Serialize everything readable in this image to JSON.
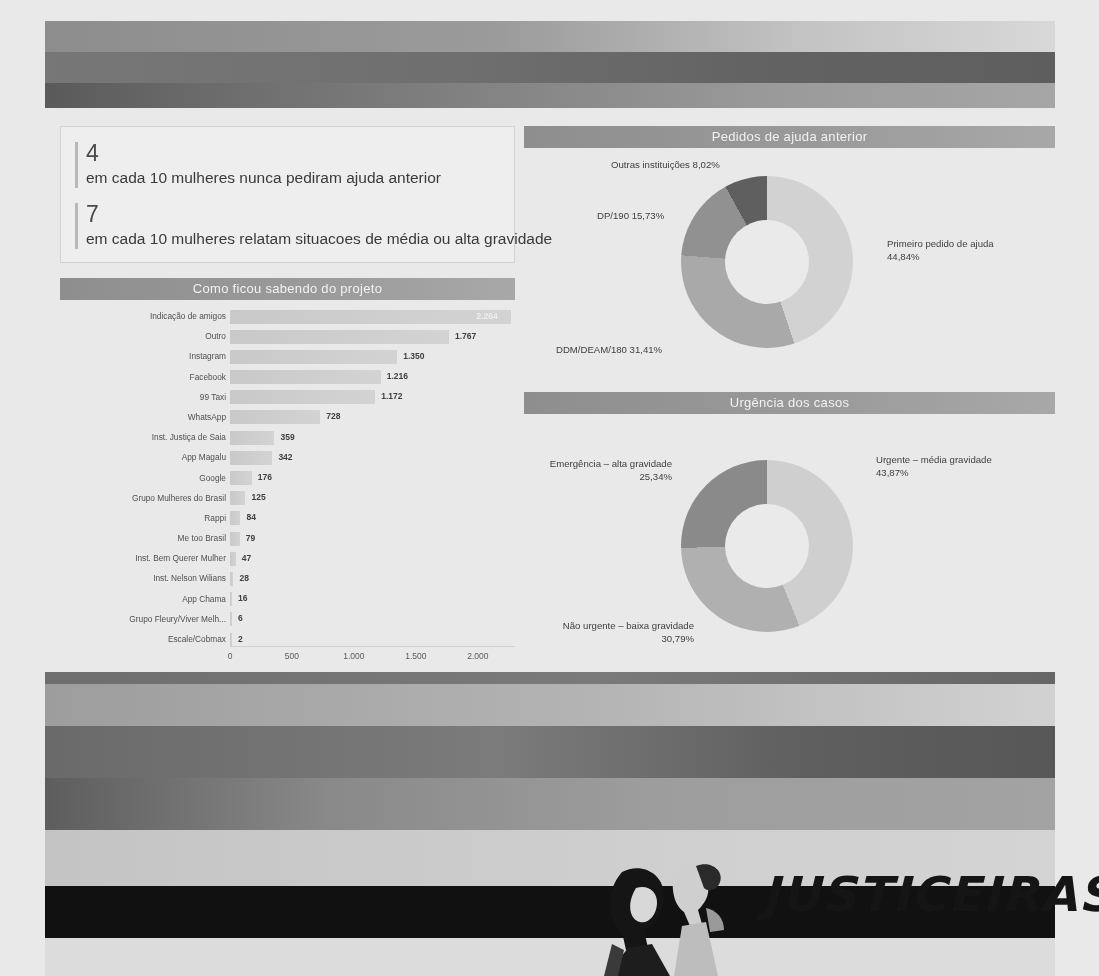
{
  "header": {
    "banner_name": "gradient-header-banner"
  },
  "kpis": [
    {
      "number": "4",
      "text": "em cada 10 mulheres nunca pediram ajuda anterior"
    },
    {
      "number": "7",
      "text": "em cada 10 mulheres relatam situacoes de média ou alta gravidade"
    }
  ],
  "chart_data": [
    {
      "type": "bar",
      "title": "Como ficou sabendo do projeto",
      "orientation": "horizontal",
      "xlabel": "",
      "ylabel": "",
      "xlim": [
        0,
        2300
      ],
      "ticks": [
        "0",
        "500",
        "1.000",
        "1.500",
        "2.000"
      ],
      "tick_values": [
        0,
        500,
        1000,
        1500,
        2000
      ],
      "grid": false,
      "categories": [
        "Indicação de amigos",
        "Outro",
        "Instagram",
        "Facebook",
        "99 Taxi",
        "WhatsApp",
        "Inst. Justiça de Saia",
        "App Magalu",
        "Google",
        "Grupo Mulheres do Brasil",
        "Rappi",
        "Me too Brasil",
        "Inst. Bem Querer Mulher",
        "Inst. Nelson Wilians",
        "App Chama",
        "Grupo Fleury/Viver Melh...",
        "Escale/Cobmax"
      ],
      "values": [
        2264,
        1767,
        1350,
        1216,
        1172,
        728,
        359,
        342,
        176,
        125,
        84,
        79,
        47,
        28,
        16,
        6,
        2
      ],
      "value_labels": [
        "2.264",
        "1.767",
        "1.350",
        "1.216",
        "1.172",
        "728",
        "359",
        "342",
        "176",
        "125",
        "84",
        "79",
        "47",
        "28",
        "16",
        "6",
        "2"
      ],
      "first_label_inside_bar": true
    },
    {
      "type": "pie",
      "variant": "donut",
      "title": "Pedidos de ajuda anterior",
      "labels": [
        "Primeiro pedido de ajuda",
        "DDM/DEAM/180",
        "DP/190",
        "Outras instituições"
      ],
      "value_labels": [
        "44,84%",
        "31,41%",
        "15,73%",
        "8,02%"
      ],
      "values": [
        44.84,
        31.41,
        15.73,
        8.02
      ],
      "annotations": [
        "Outras instituições 8,02%",
        "DP/190 15,73%",
        "DDM/DEAM/180 31,41%",
        "Primeiro pedido de ajuda\n44,84%"
      ],
      "colors": [
        "#d2d2d0",
        "#a9a9a7",
        "#919191",
        "#5f5f5f"
      ]
    },
    {
      "type": "pie",
      "variant": "donut",
      "title": "Urgência dos casos",
      "labels": [
        "Urgente – média gravidade",
        "Não urgente – baixa gravidade",
        "Emergência – alta gravidade"
      ],
      "value_labels": [
        "43,87%",
        "30,79%",
        "25,34%"
      ],
      "values": [
        43.87,
        30.79,
        25.34
      ],
      "annotations": [
        "Urgente – média gravidade\n43,87%",
        "Não urgente – baixa gravidade\n30,79%",
        "Emergência – alta gravidade\n25,34%"
      ],
      "colors": [
        "#cfcfcd",
        "#b0b0ae",
        "#8a8a88"
      ]
    }
  ],
  "footer": {
    "logo_text": "JUSTICEIRAS",
    "illustration_name": "two-women-illustration"
  }
}
